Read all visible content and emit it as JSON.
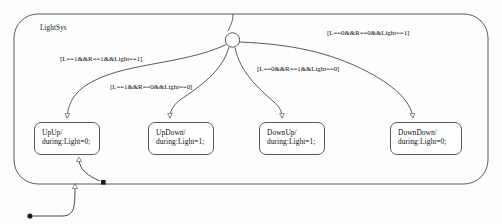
{
  "chart": {
    "title": "LightSys",
    "background_color": "#fdfdfd",
    "line_color": "#5a5a5a",
    "text_color": "#111111"
  },
  "states": [
    {
      "id": "upup",
      "name": "UpUp/",
      "action": "during:Light=0;"
    },
    {
      "id": "updown",
      "name": "UpDown/",
      "action": "during:Light=1;"
    },
    {
      "id": "downup",
      "name": "DownUp/",
      "action": "during:Light=1;"
    },
    {
      "id": "downdown",
      "name": "DownDown/",
      "action": "during:Light=0;"
    }
  ],
  "transitions": [
    {
      "id": "t-upup",
      "guard": "[L==1&&R==1&&Light==1]",
      "target": "upup"
    },
    {
      "id": "t-updown",
      "guard": "[L==1&&R==0&&Light==0]",
      "target": "updown"
    },
    {
      "id": "t-downup",
      "guard": "[L==0&&R==1&&Light==0]",
      "target": "downup"
    },
    {
      "id": "t-downdown",
      "guard": "[L==0&&R==0&&Light==1]",
      "target": "downdown"
    }
  ],
  "nodes": {
    "junction": "junction-node",
    "default_transition": "default-transition-dot",
    "terminal": "terminal-marker"
  }
}
